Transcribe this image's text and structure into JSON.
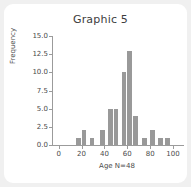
{
  "card": {
    "background": "#ffffff",
    "page_background": "#f0f0f0"
  },
  "chart_data": {
    "type": "bar",
    "title": "Graphic 5",
    "xlabel": "Age N=48",
    "ylabel": "Frequency",
    "bar_color": "#999999",
    "axis_color": "#9b9b9b",
    "grid": false,
    "legend": null,
    "xlim": [
      -5,
      107
    ],
    "ylim": [
      0,
      15
    ],
    "xticks": [
      0,
      20,
      40,
      60,
      80,
      100
    ],
    "xtick_labels": [
      "0",
      "20",
      "40",
      "60",
      "80",
      "100"
    ],
    "yticks": [
      0,
      2.5,
      5,
      7.5,
      10,
      12.5,
      15
    ],
    "ytick_labels": [
      "0.0",
      "2.5",
      "5.0",
      "7.5",
      "10.0",
      "12.5",
      "15.0"
    ],
    "bin_width": 5,
    "bins": [
      {
        "start": 15,
        "end": 20,
        "center": 17.5,
        "value": 1
      },
      {
        "start": 20,
        "end": 25,
        "center": 22.5,
        "value": 2
      },
      {
        "start": 27,
        "end": 32,
        "center": 29.5,
        "value": 1
      },
      {
        "start": 36,
        "end": 41,
        "center": 38.5,
        "value": 2
      },
      {
        "start": 43,
        "end": 48,
        "center": 45.5,
        "value": 5
      },
      {
        "start": 48,
        "end": 53,
        "center": 50.5,
        "value": 5
      },
      {
        "start": 55,
        "end": 60,
        "center": 57.5,
        "value": 10
      },
      {
        "start": 60,
        "end": 65,
        "center": 62.5,
        "value": 13
      },
      {
        "start": 65,
        "end": 70,
        "center": 67.5,
        "value": 4
      },
      {
        "start": 73,
        "end": 78,
        "center": 75.5,
        "value": 1
      },
      {
        "start": 80,
        "end": 85,
        "center": 82.5,
        "value": 2
      },
      {
        "start": 87,
        "end": 92,
        "center": 89.5,
        "value": 1
      },
      {
        "start": 93,
        "end": 98,
        "center": 95.5,
        "value": 1
      }
    ],
    "categories": [
      "17.5",
      "22.5",
      "29.5",
      "38.5",
      "45.5",
      "50.5",
      "57.5",
      "62.5",
      "67.5",
      "75.5",
      "82.5",
      "89.5",
      "95.5"
    ],
    "values": [
      1,
      2,
      1,
      2,
      5,
      5,
      10,
      13,
      4,
      1,
      2,
      1,
      1
    ],
    "total_n": 48
  }
}
